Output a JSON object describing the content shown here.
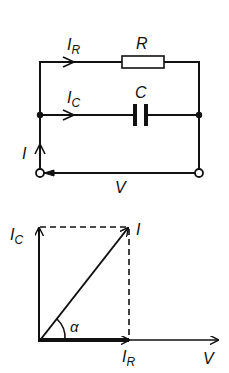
{
  "circuit": {
    "labels": {
      "resistor_current": "I",
      "resistor_current_sub": "R",
      "resistor": "R",
      "capacitor_current": "I",
      "capacitor_current_sub": "C",
      "capacitor": "C",
      "total_current": "I",
      "voltage": "V"
    }
  },
  "phasor": {
    "labels": {
      "ic": "I",
      "ic_sub": "C",
      "i": "I",
      "ir": "I",
      "ir_sub": "R",
      "v": "V",
      "angle": "α"
    }
  },
  "colors": {
    "line": "#111111",
    "background": "#ffffff"
  }
}
